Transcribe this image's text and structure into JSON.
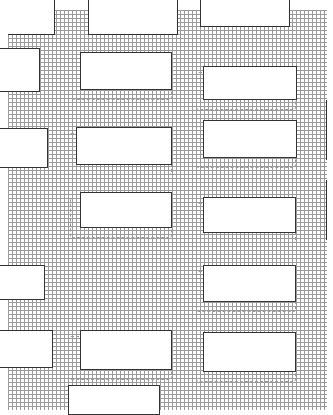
{
  "diagram": {
    "title": "",
    "colors": {
      "background": "#ffffff",
      "hatch_line": "#9a9a9a",
      "outline": "#333333"
    },
    "hatch_pitch_px": 4,
    "openings_column_1": [
      {
        "x": 80,
        "y": 52,
        "w": 92,
        "h": 38
      },
      {
        "x": 76,
        "y": 127,
        "w": 96,
        "h": 38
      },
      {
        "x": 80,
        "y": 192,
        "w": 92,
        "h": 36
      },
      {
        "x": 80,
        "y": 330,
        "w": 92,
        "h": 40
      },
      {
        "x": 68,
        "y": 385,
        "w": 92,
        "h": 25
      }
    ],
    "openings_column_2": [
      {
        "x": 203,
        "y": 66,
        "w": 94,
        "h": 34
      },
      {
        "x": 203,
        "y": 120,
        "w": 94,
        "h": 38
      },
      {
        "x": 203,
        "y": 197,
        "w": 93,
        "h": 36
      },
      {
        "x": 203,
        "y": 265,
        "w": 93,
        "h": 37
      },
      {
        "x": 203,
        "y": 332,
        "w": 93,
        "h": 40
      }
    ],
    "left_notches": [
      {
        "y": 48,
        "w": 40,
        "h": 44
      },
      {
        "y": 128,
        "w": 48,
        "h": 40
      },
      {
        "y": 265,
        "w": 45,
        "h": 35
      },
      {
        "y": 330,
        "w": 53,
        "h": 38
      }
    ],
    "top_gaps": [
      {
        "x": 0,
        "w": 55,
        "h": 35
      },
      {
        "x": 88,
        "w": 90,
        "h": 35
      },
      {
        "x": 200,
        "w": 90,
        "h": 27
      },
      {
        "x": 327,
        "w": 6,
        "h": 410
      }
    ]
  }
}
